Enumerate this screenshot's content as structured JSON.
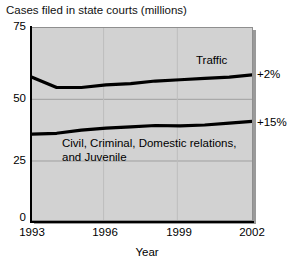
{
  "chart_data": {
    "type": "line",
    "title": "Cases filed in state courts (millions)",
    "xlabel": "Year",
    "ylabel": "",
    "xlim": [
      1993,
      2002
    ],
    "ylim": [
      0,
      75
    ],
    "grid": true,
    "legend_position": "inline",
    "x": [
      1993,
      1994,
      1995,
      1996,
      1997,
      1998,
      1999,
      2000,
      2001,
      2002
    ],
    "y_ticks": [
      0,
      25,
      50,
      75
    ],
    "x_ticks": [
      1993,
      1996,
      1999,
      2002
    ],
    "series": [
      {
        "name": "Traffic",
        "values": [
          56,
          52,
          52,
          53,
          53.5,
          54.5,
          55,
          55.5,
          56,
          57
        ],
        "annotation": "+2%"
      },
      {
        "name": "Civil, Criminal, Domestic relations, and Juvenile",
        "values": [
          34,
          34.3,
          35.5,
          36.3,
          36.8,
          37.3,
          37.2,
          37.5,
          38.2,
          39
        ],
        "annotation": "+15%"
      }
    ],
    "annotations": [
      {
        "text": "Traffic"
      },
      {
        "text": "Civil, Criminal, Domestic relations,"
      },
      {
        "text": "and Juvenile"
      },
      {
        "text": "+2%"
      },
      {
        "text": "+15%"
      }
    ],
    "colors": {
      "line": "#000000",
      "plot_background": "#d2d2d2",
      "gridline": "#9f9f9f",
      "axis": "#000000",
      "page_background": "#ffffff"
    }
  },
  "title": "Cases filed in state courts (millions)",
  "axes": {
    "x_label": "Year",
    "x_ticks": [
      "1993",
      "1996",
      "1999",
      "2002"
    ],
    "y_ticks": [
      "75",
      "50",
      "25",
      "0"
    ]
  },
  "labels": {
    "traffic": "Traffic",
    "civil_line1": "Civil, Criminal, Domestic relations,",
    "civil_line2": "and Juvenile"
  },
  "annotations": {
    "traffic_change": "+2%",
    "civil_change": "+15%"
  }
}
